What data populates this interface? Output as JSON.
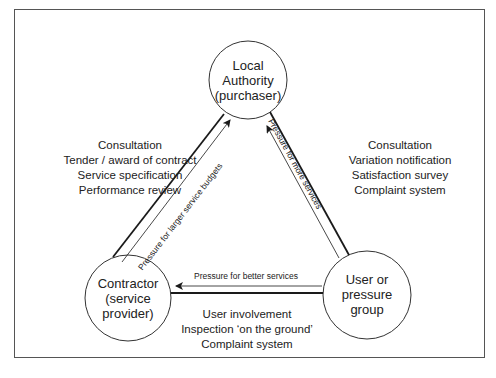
{
  "nodes": {
    "authority": {
      "lines": [
        "Local",
        "Authority",
        "(purchaser)"
      ]
    },
    "contractor": {
      "lines": [
        "Contractor",
        "(service",
        "provider)"
      ]
    },
    "user": {
      "lines": [
        "User or",
        "pressure",
        "group"
      ]
    }
  },
  "relationships": {
    "authority_contractor": [
      "Consultation",
      "Tender / award of contract",
      "Service specification",
      "Performance review"
    ],
    "authority_user": [
      "Consultation",
      "Variation notification",
      "Satisfaction survey",
      "Complaint system"
    ],
    "contractor_user": [
      "User involvement",
      "Inspection ‘on the ground’",
      "Complaint system"
    ]
  },
  "pressures": {
    "contractor_to_authority": "Pressure for larger service budgets",
    "user_to_authority": "Pressure for more services",
    "user_to_contractor": "Pressure for better services"
  },
  "colors": {
    "line": "#1a1a1a",
    "frame": "#555555",
    "background": "#ffffff"
  }
}
